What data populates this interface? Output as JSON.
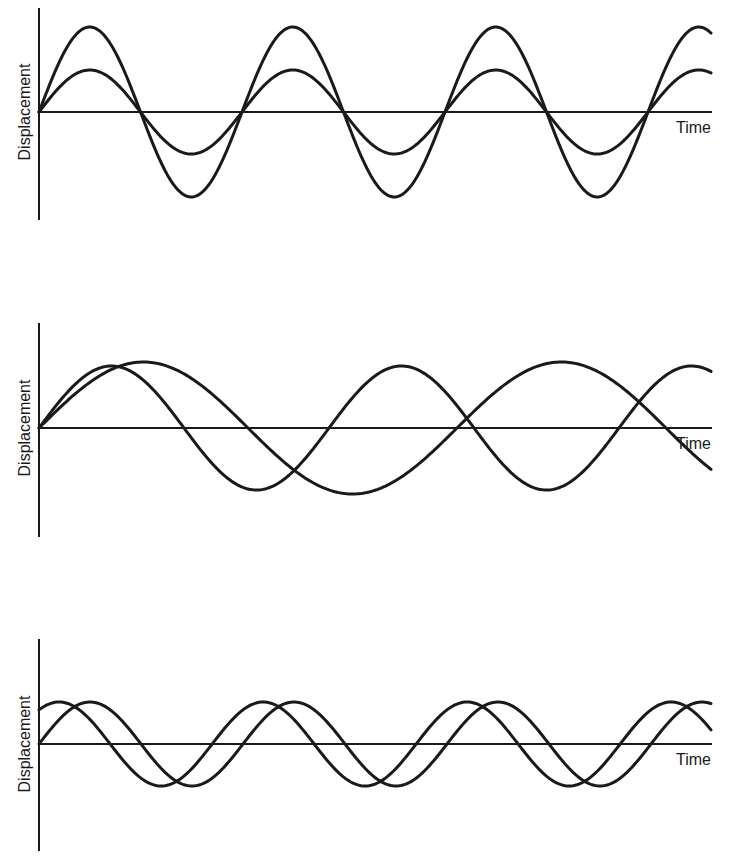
{
  "figure": {
    "panels": [
      {
        "ylabel": "Displacement",
        "xlabel": "Time"
      },
      {
        "ylabel": "Displacement",
        "xlabel": "Time"
      },
      {
        "ylabel": "Displacement",
        "xlabel": "Time"
      }
    ]
  },
  "chart_data": [
    {
      "type": "line",
      "title": "",
      "xlabel": "Time",
      "ylabel": "Displacement",
      "description": "Same frequency, same phase, different amplitudes",
      "grid": false,
      "ticks": false,
      "color": "#1a1a1a",
      "layout": {
        "left": 39,
        "right": 712,
        "baseline": 112,
        "axis_top": 8,
        "axis_bottom": 220
      },
      "series": [
        {
          "name": "wave-large",
          "amplitude_px": 85,
          "period_px": 203,
          "phase_rad": 0
        },
        {
          "name": "wave-small",
          "amplitude_px": 42,
          "period_px": 203,
          "phase_rad": 0
        }
      ],
      "relative": {
        "amplitude_ratio": 2.0,
        "frequency_ratio": 1.0,
        "phase_difference_deg": 0
      }
    },
    {
      "type": "line",
      "title": "",
      "xlabel": "Time",
      "ylabel": "Displacement",
      "description": "Different frequencies, similar amplitudes",
      "grid": false,
      "ticks": false,
      "color": "#1a1a1a",
      "layout": {
        "left": 39,
        "right": 712,
        "baseline": 428,
        "axis_top": 323,
        "axis_bottom": 537
      },
      "series": [
        {
          "name": "wave-fast",
          "amplitude_px": 62,
          "period_px": 290,
          "phase_rad": 0
        },
        {
          "name": "wave-slow",
          "amplitude_px": 66,
          "period_px": 418,
          "phase_rad": 0
        }
      ],
      "relative": {
        "amplitude_ratio": 1.0,
        "frequency_ratio": 1.44,
        "phase_difference_deg": 0
      }
    },
    {
      "type": "line",
      "title": "",
      "xlabel": "Time",
      "ylabel": "Displacement",
      "description": "Same frequency and amplitude, phase shifted",
      "grid": false,
      "ticks": false,
      "color": "#1a1a1a",
      "layout": {
        "left": 39,
        "right": 712,
        "baseline": 744,
        "axis_top": 639,
        "axis_bottom": 851
      },
      "series": [
        {
          "name": "wave-reference",
          "amplitude_px": 42,
          "period_px": 204,
          "phase_rad": 0
        },
        {
          "name": "wave-leading",
          "amplitude_px": 42,
          "period_px": 204,
          "phase_rad": 0.95
        }
      ],
      "relative": {
        "amplitude_ratio": 1.0,
        "frequency_ratio": 1.0,
        "phase_difference_deg": 55
      }
    }
  ]
}
